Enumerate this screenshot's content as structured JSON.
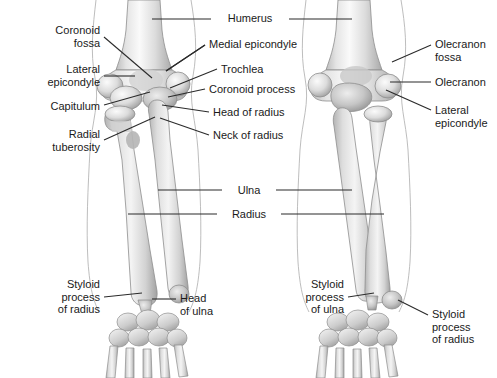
{
  "figure": {
    "background": "#ffffff",
    "text_color": "#1a1a1a",
    "leader_color": "#2b2b2b",
    "bone_fill_light": "#f2f2f2",
    "bone_fill_mid": "#d8d8d8",
    "bone_fill_dark": "#a8a8a8",
    "outline_color": "#9a9a9a"
  },
  "labels": [
    {
      "id": "coronoid-fossa",
      "text": "Coronoid\nfossa",
      "align": "right",
      "x": 8,
      "y": 24,
      "w": 92
    },
    {
      "id": "lateral-epicondyle-left",
      "text": "Lateral\nepicondyle",
      "align": "right",
      "x": 4,
      "y": 63,
      "w": 96
    },
    {
      "id": "capitulum",
      "text": "Capitulum",
      "align": "right",
      "x": 4,
      "y": 100,
      "w": 96
    },
    {
      "id": "radial-tuberosity",
      "text": "Radial\ntuberosity",
      "align": "right",
      "x": 4,
      "y": 128,
      "w": 96
    },
    {
      "id": "styloid-process-of-radius-left",
      "text": "Styloid\nprocess\nof radius",
      "align": "right",
      "x": 4,
      "y": 278,
      "w": 96
    },
    {
      "id": "humerus",
      "text": "Humerus",
      "align": "center",
      "x": 215,
      "y": 12,
      "w": 70
    },
    {
      "id": "medial-epicondyle",
      "text": "Medial epicondyle",
      "align": "left",
      "x": 209,
      "y": 38,
      "w": 110
    },
    {
      "id": "trochlea",
      "text": "Trochlea",
      "align": "left",
      "x": 221,
      "y": 63,
      "w": 90
    },
    {
      "id": "coronoid-process",
      "text": "Coronoid process",
      "align": "left",
      "x": 209,
      "y": 83,
      "w": 110
    },
    {
      "id": "head-of-radius",
      "text": "Head of radius",
      "align": "left",
      "x": 213,
      "y": 106,
      "w": 100
    },
    {
      "id": "neck-of-radius",
      "text": "Neck of radius",
      "align": "left",
      "x": 213,
      "y": 129,
      "w": 100
    },
    {
      "id": "ulna",
      "text": "Ulna",
      "align": "center",
      "x": 226,
      "y": 184,
      "w": 46
    },
    {
      "id": "radius",
      "text": "Radius",
      "align": "center",
      "x": 221,
      "y": 208,
      "w": 56
    },
    {
      "id": "head-of-ulna",
      "text": "Head\nof ulna",
      "align": "left",
      "x": 180,
      "y": 292,
      "w": 60
    },
    {
      "id": "olecranon-fossa",
      "text": "Olecranon\nfossa",
      "align": "left",
      "x": 435,
      "y": 38,
      "w": 62
    },
    {
      "id": "olecranon",
      "text": "Olecranon",
      "align": "left",
      "x": 435,
      "y": 76,
      "w": 62
    },
    {
      "id": "lateral-epicondyle-right",
      "text": "Lateral\nepicondyle",
      "align": "left",
      "x": 435,
      "y": 104,
      "w": 62
    },
    {
      "id": "styloid-process-of-ulna",
      "text": "Styloid\nprocess\nof ulna",
      "align": "right",
      "x": 272,
      "y": 278,
      "w": 72
    },
    {
      "id": "styloid-process-of-radius-right",
      "text": "Styloid\nprocess\nof radius",
      "align": "left",
      "x": 432,
      "y": 308,
      "w": 65
    }
  ],
  "leaders": [
    {
      "id": "leader-coronoid-fossa",
      "points": "104,37 152,78"
    },
    {
      "id": "leader-lateral-epicondyle-left",
      "points": "104,76 135,76"
    },
    {
      "id": "leader-capitulum",
      "points": "104,105 150,92"
    },
    {
      "id": "leader-radial-tuberosity",
      "points": "104,140 155,117"
    },
    {
      "id": "leader-styloid-radius-left",
      "points": "104,297 142,293"
    },
    {
      "id": "leader-humerus-left",
      "points": "211,19 152,19"
    },
    {
      "id": "leader-humerus-right",
      "points": "289,19 352,19"
    },
    {
      "id": "leader-medial-epicondyle",
      "points": "205,45 166,71"
    },
    {
      "id": "leader-trochlea",
      "points": "217,69 170,88"
    },
    {
      "id": "leader-coronoid-process",
      "points": "205,89 168,97"
    },
    {
      "id": "leader-head-of-radius",
      "points": "209,112 162,105"
    },
    {
      "id": "leader-neck-of-radius",
      "points": "209,135 160,118"
    },
    {
      "id": "leader-ulna-left",
      "points": "222,190 158,190"
    },
    {
      "id": "leader-ulna-right",
      "points": "276,190 352,190"
    },
    {
      "id": "leader-radius-left",
      "points": "217,214 128,214"
    },
    {
      "id": "leader-radius-right",
      "points": "281,214 384,214"
    },
    {
      "id": "leader-head-of-ulna",
      "points": "176,299 152,299"
    },
    {
      "id": "leader-olecranon-fossa",
      "points": "431,45 392,62"
    },
    {
      "id": "leader-olecranon",
      "points": "431,82 390,82"
    },
    {
      "id": "leader-lateral-epicondyle-right",
      "points": "431,110 386,90"
    },
    {
      "id": "leader-styloid-ulna",
      "points": "348,297 374,293"
    },
    {
      "id": "leader-styloid-radius-right",
      "points": "428,315 398,300"
    },
    {
      "id": "leader-medial-epi-right-tip",
      "points": "205,45 166,71"
    }
  ]
}
